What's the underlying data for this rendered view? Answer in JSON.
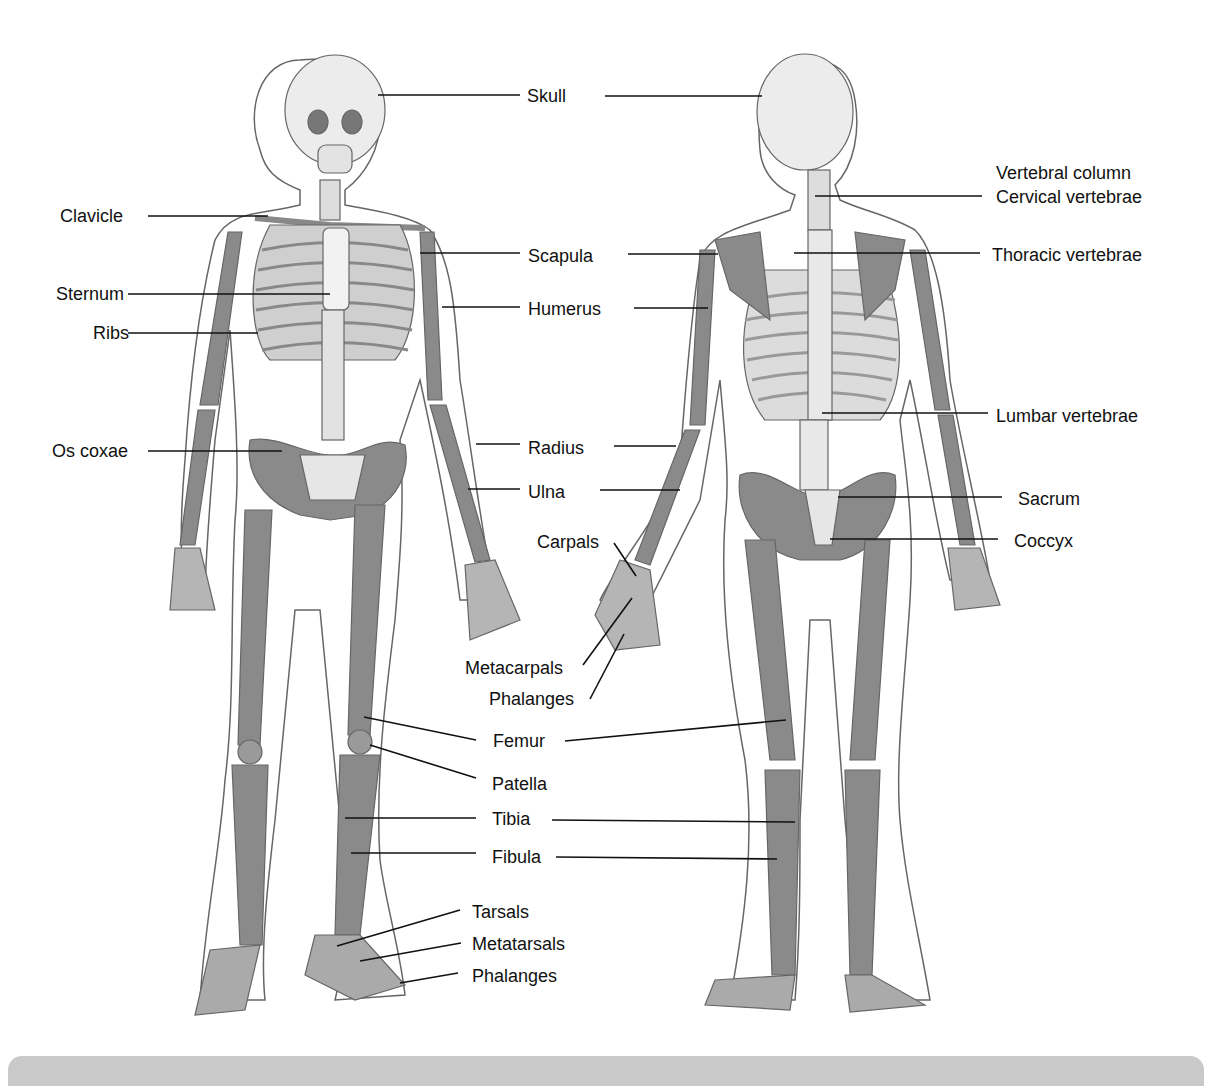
{
  "figure": {
    "views": [
      "anterior",
      "posterior"
    ],
    "colors": {
      "bone_dark": "#8a8a8a",
      "bone_light": "#e6e6e6",
      "outline": "#555555",
      "leader": "#111111",
      "bottom_bar": "#c9c9c9"
    }
  },
  "labels": {
    "skull": "Skull",
    "clavicle": "Clavicle",
    "sternum": "Sternum",
    "ribs": "Ribs",
    "os_coxae": "Os coxae",
    "scapula": "Scapula",
    "humerus": "Humerus",
    "radius": "Radius",
    "ulna": "Ulna",
    "carpals": "Carpals",
    "metacarpals": "Metacarpals",
    "phalanges_hand": "Phalanges",
    "femur": "Femur",
    "patella": "Patella",
    "tibia": "Tibia",
    "fibula": "Fibula",
    "tarsals": "Tarsals",
    "metatarsals": "Metatarsals",
    "phalanges_foot": "Phalanges",
    "vertebral_column": "Vertebral column",
    "cervical": "Cervical vertebrae",
    "thoracic": "Thoracic vertebrae",
    "lumbar": "Lumbar vertebrae",
    "sacrum": "Sacrum",
    "coccyx": "Coccyx"
  }
}
